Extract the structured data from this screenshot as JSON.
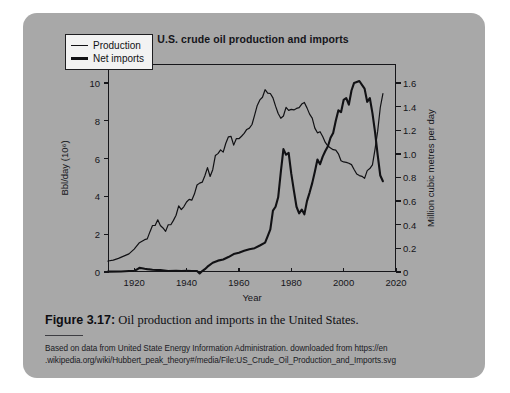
{
  "figure": {
    "label": "Figure 3.17:",
    "caption": " Oil production and imports in the United States.",
    "source_line_1": "Based on data from United State Energy Information Administration. downloaded from https://en",
    "source_line_2": ".wikipedia.org/wiki/Hubbert_peak_theory#/media/File:US_Crude_Oil_Production_and_Imports.svg",
    "card_color": "#a8a8a8",
    "page_color": "#ffffff"
  },
  "chart_data": {
    "type": "line",
    "title": "U.S. crude oil production and imports",
    "xlabel": "Year",
    "ylabel": "Bbl/day (10⁶)",
    "ylabel_right": "Million cubic metres per day",
    "xlim": [
      1910,
      2020
    ],
    "ylim": [
      0,
      11
    ],
    "ylim_right": [
      0,
      1.76
    ],
    "grid": false,
    "legend_position": "top-left",
    "xticks": [
      1920,
      1940,
      1960,
      1980,
      2000,
      2020
    ],
    "xtick_labels": [
      "1920",
      "1940",
      "1960",
      "1980",
      "2000",
      "2020"
    ],
    "yticks": [
      0,
      2,
      4,
      6,
      8,
      10
    ],
    "ytick_labels": [
      "0",
      "2",
      "4",
      "6",
      "8",
      "10"
    ],
    "yticks_right": [
      0,
      0.2,
      0.4,
      0.6,
      0.8,
      1.0,
      1.2,
      1.4,
      1.6
    ],
    "ytick_labels_right": [
      "0",
      "0.2",
      "0.4",
      "0.6",
      "0.8",
      "1.0",
      "1.2",
      "1.4",
      "1.6"
    ],
    "line_color": "#111114",
    "series": [
      {
        "name": "Production",
        "line_width": 1.2,
        "x": [
          1910,
          1912,
          1914,
          1916,
          1918,
          1920,
          1922,
          1924,
          1925,
          1926,
          1927,
          1928,
          1929,
          1930,
          1931,
          1932,
          1933,
          1934,
          1935,
          1936,
          1937,
          1938,
          1939,
          1940,
          1941,
          1942,
          1943,
          1944,
          1945,
          1946,
          1947,
          1948,
          1949,
          1950,
          1951,
          1952,
          1953,
          1954,
          1955,
          1956,
          1957,
          1958,
          1959,
          1960,
          1961,
          1962,
          1963,
          1964,
          1965,
          1966,
          1967,
          1968,
          1969,
          1970,
          1971,
          1972,
          1973,
          1974,
          1975,
          1976,
          1977,
          1978,
          1979,
          1980,
          1981,
          1982,
          1983,
          1984,
          1985,
          1986,
          1987,
          1988,
          1989,
          1990,
          1991,
          1992,
          1993,
          1994,
          1995,
          1996,
          1997,
          1998,
          1999,
          2000,
          2001,
          2002,
          2003,
          2004,
          2005,
          2006,
          2007,
          2008,
          2009,
          2010,
          2011,
          2012,
          2013,
          2014,
          2015
        ],
        "y": [
          0.58,
          0.63,
          0.72,
          0.84,
          0.96,
          1.21,
          1.55,
          1.71,
          1.75,
          2.12,
          2.46,
          2.46,
          2.76,
          2.46,
          2.33,
          2.15,
          2.5,
          2.5,
          2.73,
          3.0,
          3.5,
          3.3,
          3.46,
          3.7,
          3.84,
          3.8,
          4.12,
          4.6,
          4.7,
          4.75,
          5.09,
          5.52,
          5.05,
          5.41,
          6.16,
          6.26,
          6.46,
          6.34,
          6.81,
          7.15,
          7.17,
          6.71,
          7.05,
          7.05,
          7.18,
          7.33,
          7.54,
          7.61,
          7.8,
          8.3,
          8.81,
          9.1,
          9.24,
          9.64,
          9.46,
          9.44,
          9.21,
          8.77,
          8.38,
          8.13,
          8.25,
          8.71,
          8.55,
          8.6,
          8.57,
          8.65,
          8.69,
          8.88,
          8.97,
          8.68,
          8.35,
          8.14,
          7.61,
          7.36,
          7.42,
          7.17,
          6.85,
          6.66,
          6.56,
          6.47,
          6.45,
          6.25,
          5.88,
          5.82,
          5.8,
          5.75,
          5.68,
          5.42,
          5.18,
          5.1,
          5.06,
          4.95,
          5.36,
          5.47,
          5.67,
          6.5,
          7.45,
          8.7,
          9.43
        ]
      },
      {
        "name": "Net imports",
        "line_width": 2.1,
        "x": [
          1910,
          1915,
          1918,
          1920,
          1921,
          1922,
          1923,
          1924,
          1925,
          1927,
          1930,
          1933,
          1936,
          1938,
          1940,
          1942,
          1944,
          1945,
          1946,
          1947,
          1948,
          1950,
          1952,
          1954,
          1956,
          1958,
          1960,
          1962,
          1964,
          1966,
          1968,
          1970,
          1971,
          1972,
          1973,
          1974,
          1975,
          1976,
          1977,
          1978,
          1979,
          1980,
          1981,
          1982,
          1983,
          1984,
          1985,
          1986,
          1987,
          1988,
          1989,
          1990,
          1991,
          1992,
          1993,
          1994,
          1995,
          1996,
          1997,
          1998,
          1999,
          2000,
          2001,
          2002,
          2003,
          2004,
          2005,
          2006,
          2007,
          2008,
          2009,
          2010,
          2011,
          2012,
          2013,
          2014,
          2015
        ],
        "y": [
          0.02,
          0.03,
          0.05,
          0.06,
          0.13,
          0.22,
          0.2,
          0.17,
          0.15,
          0.12,
          0.1,
          0.05,
          0.06,
          0.05,
          0.06,
          0.05,
          0.05,
          -0.08,
          0.05,
          0.15,
          0.28,
          0.49,
          0.6,
          0.66,
          0.79,
          0.95,
          1.02,
          1.12,
          1.2,
          1.26,
          1.4,
          1.55,
          1.9,
          2.25,
          3.25,
          3.45,
          3.95,
          5.28,
          6.5,
          6.2,
          6.3,
          5.2,
          4.3,
          3.45,
          3.1,
          3.3,
          3.05,
          3.75,
          4.2,
          4.7,
          5.3,
          5.95,
          5.7,
          6.1,
          6.4,
          6.65,
          7.1,
          7.35,
          8.0,
          8.55,
          8.45,
          9.1,
          9.2,
          8.85,
          9.6,
          10.0,
          10.05,
          10.1,
          9.9,
          9.7,
          9.0,
          9.2,
          8.4,
          7.4,
          6.2,
          5.1,
          4.8
        ]
      }
    ]
  }
}
